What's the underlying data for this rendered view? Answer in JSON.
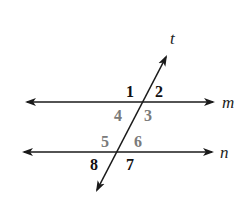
{
  "diagram": {
    "colors": {
      "line": "#1a1a1a",
      "label_dark": "#111111",
      "label_gray": "#7a7a7a"
    },
    "lines": {
      "m": {
        "label": "m",
        "y": 102,
        "x1": 27,
        "x2": 213
      },
      "n": {
        "label": "n",
        "y": 152,
        "x1": 24,
        "x2": 212
      },
      "t": {
        "label": "t",
        "x1": 166,
        "y1": 57,
        "x2": 97,
        "y2": 190
      }
    },
    "angles": [
      {
        "id": "1",
        "label": "1",
        "color": "dark"
      },
      {
        "id": "2",
        "label": "2",
        "color": "dark"
      },
      {
        "id": "3",
        "label": "3",
        "color": "gray"
      },
      {
        "id": "4",
        "label": "4",
        "color": "gray"
      },
      {
        "id": "5",
        "label": "5",
        "color": "gray"
      },
      {
        "id": "6",
        "label": "6",
        "color": "gray"
      },
      {
        "id": "7",
        "label": "7",
        "color": "dark"
      },
      {
        "id": "8",
        "label": "8",
        "color": "dark"
      }
    ]
  }
}
